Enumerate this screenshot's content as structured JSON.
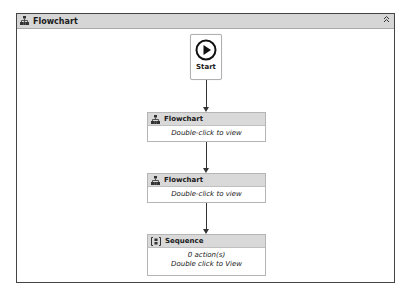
{
  "designer": {
    "title": "Flowchart",
    "title_icon": "flowchart-icon",
    "collapse_icon": "double-chevron-up-icon",
    "collapse_glyph": "»"
  },
  "start_node": {
    "label": "Start",
    "icon": "play-circle-icon"
  },
  "activities": [
    {
      "type": "Flowchart",
      "icon": "flowchart-icon",
      "body_lines": [
        "Double-click to view"
      ]
    },
    {
      "type": "Flowchart",
      "icon": "flowchart-icon",
      "body_lines": [
        "Double-click to view"
      ]
    },
    {
      "type": "Sequence",
      "icon": "sequence-icon",
      "body_lines": [
        "0 action(s)",
        "Double click to View"
      ]
    }
  ],
  "colors": {
    "header_bg": "#d6d6d6",
    "activity_header_bg": "#d9d9d9",
    "connector": "#333333"
  }
}
